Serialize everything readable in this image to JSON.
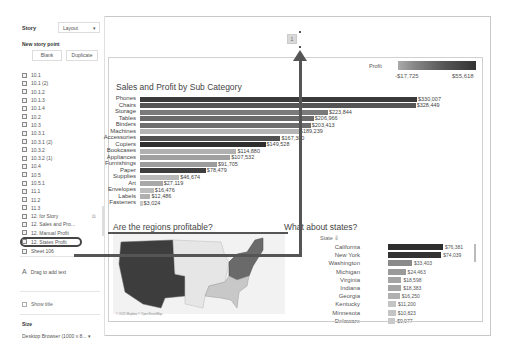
{
  "sidebar": {
    "tab_story": "Story",
    "tab_layout": "Layout",
    "new_story_point": "New story point",
    "blank_button": "Blank",
    "duplicate_button": "Duplicate",
    "items": [
      {
        "label": "10.1"
      },
      {
        "label": "10.1 (2)"
      },
      {
        "label": "10.1.2"
      },
      {
        "label": "10.1.3"
      },
      {
        "label": "10.1.4"
      },
      {
        "label": "10.2"
      },
      {
        "label": "10.3"
      },
      {
        "label": "10.3.1"
      },
      {
        "label": "10.3.1 (2)"
      },
      {
        "label": "10.3.2"
      },
      {
        "label": "10.3.2 (1)"
      },
      {
        "label": "10.4"
      },
      {
        "label": "10.5"
      },
      {
        "label": "10.5.1"
      },
      {
        "label": "11.1"
      },
      {
        "label": "11.2"
      },
      {
        "label": "11.3"
      },
      {
        "label": "12. for Story"
      },
      {
        "label": "12. Sales and Pro..."
      },
      {
        "label": "12. Manual Profit"
      },
      {
        "label": "12. States Profit"
      },
      {
        "label": "Sheet 106"
      }
    ],
    "selected_item": "12. States Profit",
    "drag_text": "Drag to add text",
    "show_title": "Show title",
    "size_label": "Size",
    "size_value": "Desktop Browser (1000 x 8... ▾"
  },
  "navigator": {
    "box_label": "1"
  },
  "dashboard": {
    "chart_title": "Sales and Profit by Sub Category",
    "legend": {
      "title": "Profit",
      "min": "-$17,725",
      "max": "$55,618"
    },
    "regions_title": "Are the regions profitable?",
    "states_title": "What about states?",
    "states_header": "State",
    "map_credit": "© 2021 Mapbox © OpenStreetMap"
  },
  "chart_data": [
    {
      "type": "bar",
      "title": "Sales and Profit by Sub Category",
      "orientation": "horizontal",
      "categories": [
        "Phones",
        "Chairs",
        "Storage",
        "Tables",
        "Binders",
        "Machines",
        "Accessories",
        "Copiers",
        "Bookcases",
        "Appliances",
        "Furnishings",
        "Paper",
        "Supplies",
        "Art",
        "Envelopes",
        "Labels",
        "Fasteners"
      ],
      "values": [
        330007,
        328449,
        223844,
        206966,
        203413,
        189239,
        167380,
        149528,
        114880,
        107532,
        91705,
        78479,
        46674,
        27119,
        16476,
        12486,
        3024
      ],
      "labels": [
        "$330,007",
        "$328,449",
        "$223,844",
        "$206,966",
        "$203,413",
        "$189,239",
        "$167,380",
        "$149,528",
        "$114,880",
        "$107,532",
        "$91,705",
        "$78,479",
        "$46,674",
        "$27,119",
        "$16,476",
        "$12,486",
        "$3,024"
      ],
      "color_legend": {
        "title": "Profit",
        "min": "-$17,725",
        "max": "$55,618"
      }
    },
    {
      "type": "bar",
      "title": "What about states?",
      "orientation": "horizontal",
      "categories": [
        "California",
        "New York",
        "Washington",
        "Michigan",
        "Virginia",
        "Indiana",
        "Georgia",
        "Kentucky",
        "Minnesota",
        "Delaware"
      ],
      "values": [
        76381,
        74039,
        33403,
        24463,
        18598,
        18383,
        16250,
        11200,
        10823,
        9977
      ],
      "labels": [
        "$76,381",
        "$74,039",
        "$33,403",
        "$24,463",
        "$18,598",
        "$18,383",
        "$16,250",
        "$11,200",
        "$10,823",
        "$9,977"
      ]
    }
  ],
  "colors": {
    "dark": "#3a3a3a",
    "mid": "#6e6e6e",
    "light": "#a8a8a8",
    "lighter": "#c4c4c4",
    "annotation": "#555555"
  },
  "bar_shades": [
    "#3a3a3a",
    "#555555",
    "#7a7a7a",
    "#6a6a6a",
    "#6e6e6e",
    "#b5b5b5",
    "#505050",
    "#2e2e2e",
    "#b0b0b0",
    "#a0a0a0",
    "#9c9c9c",
    "#3e3e3e",
    "#b8b8b8",
    "#a8a8a8",
    "#bcbcbc",
    "#b0b0b0",
    "#c8c8c8"
  ],
  "state_shades": [
    "#2e2e2e",
    "#333333",
    "#8a8a8a",
    "#9a9a9a",
    "#a4a4a4",
    "#a4a4a4",
    "#b0b0b0",
    "#c4c4c4",
    "#c4c4c4",
    "#c8c8c8"
  ]
}
